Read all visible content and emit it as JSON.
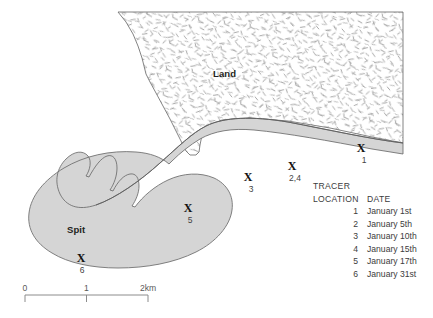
{
  "figure": {
    "type": "coastal-spit-tracer-map",
    "background_color": "#ffffff"
  },
  "map": {
    "labels": {
      "land": "Land",
      "spit": "Spit"
    },
    "colors": {
      "land_fill": "#ffffff",
      "land_stipple": "#8c8c8c",
      "beach_fill": "#d6d6d6",
      "spit_fill": "#d2d2d2",
      "outline": "#555555",
      "text": "#231f20"
    },
    "marker_glyph": "X",
    "markers": [
      {
        "id": "marker-1",
        "glyph": "X",
        "label": "1",
        "x": 361,
        "y": 148,
        "label_x": 364,
        "label_y": 155
      },
      {
        "id": "marker-2-4",
        "glyph": "X",
        "label": "2,4",
        "x": 292,
        "y": 166,
        "label_x": 295,
        "label_y": 173
      },
      {
        "id": "marker-3",
        "glyph": "X",
        "label": "3",
        "x": 248,
        "y": 177,
        "label_x": 251,
        "label_y": 184
      },
      {
        "id": "marker-5",
        "glyph": "X",
        "label": "5",
        "x": 188,
        "y": 208,
        "label_x": 190,
        "label_y": 215
      },
      {
        "id": "marker-6",
        "glyph": "X",
        "label": "6",
        "x": 81,
        "y": 258,
        "label_x": 82,
        "label_y": 265
      }
    ]
  },
  "legend": {
    "title": "TRACER",
    "header": {
      "location": "LOCATION",
      "date": "DATE"
    },
    "rows": [
      {
        "location": "1",
        "date": "January 1st"
      },
      {
        "location": "2",
        "date": "January 5th"
      },
      {
        "location": "3",
        "date": "January 10th"
      },
      {
        "location": "4",
        "date": "January 15th"
      },
      {
        "location": "5",
        "date": "January 17th"
      },
      {
        "location": "6",
        "date": "January 31st"
      }
    ]
  },
  "scale": {
    "ticks": [
      {
        "label": "0",
        "pos": 0
      },
      {
        "label": "1",
        "pos": 50
      },
      {
        "label": "2km",
        "pos": 100
      }
    ],
    "line_color": "#8c8c8c"
  }
}
